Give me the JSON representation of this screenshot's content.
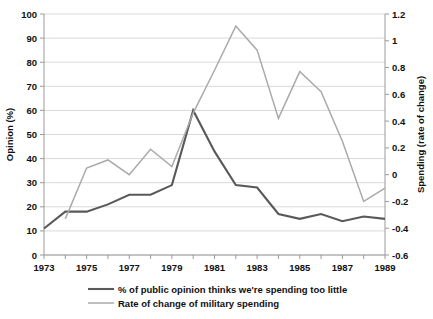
{
  "chart_data": {
    "type": "line",
    "title": "",
    "xlabel": "",
    "ylabel": "Opinion (%)",
    "y2label": "Spending (rate of change)",
    "grid": true,
    "legend_position": "bottom",
    "x": [
      1973,
      1974,
      1975,
      1976,
      1977,
      1978,
      1979,
      1980,
      1981,
      1982,
      1983,
      1984,
      1985,
      1986,
      1987,
      1988,
      1989
    ],
    "xlim": [
      1973,
      1989
    ],
    "xticks": [
      1973,
      1975,
      1977,
      1979,
      1981,
      1983,
      1985,
      1987,
      1989
    ],
    "xticklabels": [
      "1973",
      "1975",
      "1977",
      "1979",
      "1981",
      "1983",
      "1985",
      "1987",
      "1989"
    ],
    "ylim": [
      0,
      100
    ],
    "yticks": [
      0,
      10,
      20,
      30,
      40,
      50,
      60,
      70,
      80,
      90,
      100
    ],
    "yticklabels": [
      "0",
      "10",
      "20",
      "30",
      "40",
      "50",
      "60",
      "70",
      "80",
      "90",
      "100"
    ],
    "y2lim": [
      -0.6,
      1.2
    ],
    "y2ticks": [
      -0.6,
      -0.4,
      -0.2,
      0,
      0.2,
      0.4,
      0.6,
      0.8,
      1,
      1.2
    ],
    "y2ticklabels": [
      "-0.6",
      "-0.4",
      "-0.2",
      "0",
      "0.2",
      "0.4",
      "0.6",
      "0.8",
      "1",
      "1.2"
    ],
    "series": [
      {
        "name": "% of public opinion thinks we're spending too little",
        "axis": "left",
        "color": "#595959",
        "width": 2.1,
        "x": [
          1973,
          1974,
          1975,
          1976,
          1977,
          1978,
          1979,
          1980,
          1981,
          1982,
          1983,
          1984,
          1985,
          1986,
          1987,
          1988,
          1989
        ],
        "values": [
          11,
          18,
          18,
          21,
          25,
          25,
          29,
          60,
          43,
          29,
          28,
          17,
          15,
          17,
          14,
          16,
          15
        ]
      },
      {
        "name": "Rate of change of military spending",
        "axis": "right",
        "color": "#aaaaaa",
        "width": 1.5,
        "x": [
          1974,
          1975,
          1976,
          1977,
          1978,
          1979,
          1980,
          1981,
          1982,
          1983,
          1984,
          1985,
          1986,
          1987,
          1988,
          1989
        ],
        "values": [
          -0.33,
          0.05,
          0.11,
          0.0,
          0.19,
          0.06,
          0.46,
          0.78,
          1.11,
          0.93,
          0.42,
          0.77,
          0.62,
          0.25,
          -0.2,
          -0.1
        ]
      }
    ]
  },
  "legend": {
    "items": [
      {
        "label": "% of public opinion thinks we're spending too little",
        "color": "#595959"
      },
      {
        "label": "Rate of change of military spending",
        "color": "#aaaaaa"
      }
    ]
  }
}
